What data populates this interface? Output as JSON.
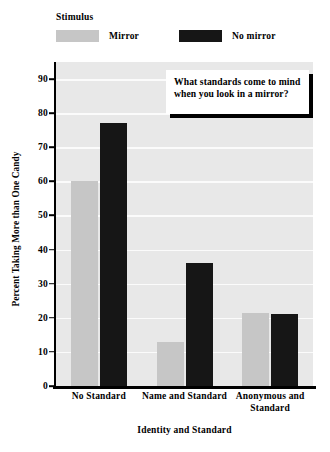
{
  "legend": {
    "title": "Stimulus",
    "entries": [
      {
        "label": "Mirror",
        "color": "#c6c6c6",
        "swatch_name": "legend-swatch-mirror"
      },
      {
        "label": "No mirror",
        "color": "#161616",
        "swatch_name": "legend-swatch-no-mirror"
      }
    ]
  },
  "annotation": {
    "text": "What standards come to mind when you look in a mirror?"
  },
  "chart_data": {
    "type": "bar",
    "title": "",
    "xlabel": "Identity and Standard",
    "ylabel": "Percent Taking More than One Candy",
    "categories": [
      "No Standard",
      "Name and Standard",
      "Anonymous and Standard"
    ],
    "series": [
      {
        "name": "Mirror",
        "color": "#c6c6c6",
        "values": [
          60,
          13,
          21.5
        ]
      },
      {
        "name": "No mirror",
        "color": "#161616",
        "values": [
          77,
          36,
          21
        ]
      }
    ],
    "ylim": [
      0,
      95
    ],
    "yticks": [
      0,
      10,
      20,
      30,
      40,
      50,
      60,
      70,
      80,
      90
    ],
    "ytick_labels": [
      "0",
      "10",
      "20",
      "30",
      "40",
      "50",
      "60",
      "70",
      "80",
      "90"
    ],
    "grid": true,
    "grid_color": "#fbfbfb",
    "plot_background": "#e8e8e8",
    "legend_position": "above-plot"
  }
}
